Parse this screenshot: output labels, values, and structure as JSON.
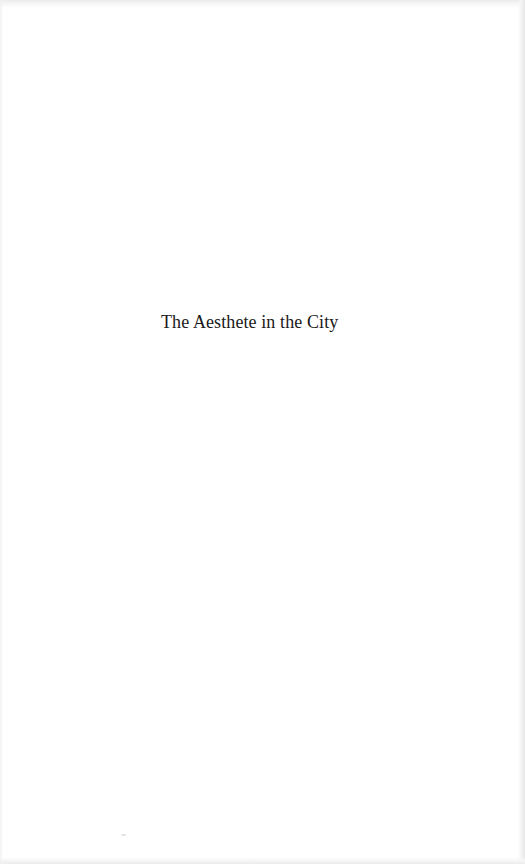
{
  "page": {
    "type": "half-title page",
    "title": "The Aesthete in the City"
  },
  "colors": {
    "background": "#ffffff",
    "text": "#1a1a1a",
    "edge_shading": "#e6e6e6"
  }
}
